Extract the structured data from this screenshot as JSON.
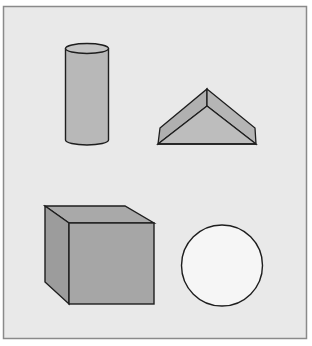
{
  "figure": {
    "background": "#e9e9e9",
    "frame_color": "#8a8a8a",
    "stroke_color": "#1e1e1e",
    "shapes": [
      {
        "name": "cylinder",
        "fill": "#b8b8b8",
        "top_fill": "#c4c4c4"
      },
      {
        "name": "triangular-prism",
        "fill": "#b5b5b5",
        "front_fill": "#bdbdbd"
      },
      {
        "name": "cube",
        "front_fill": "#a6a6a6",
        "top_fill": "#a9a9a9",
        "side_fill": "#9c9c9c"
      },
      {
        "name": "circle",
        "fill": "#f6f6f6"
      }
    ]
  }
}
